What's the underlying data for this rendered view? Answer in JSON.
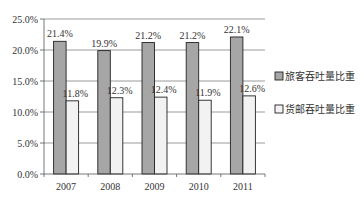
{
  "chart_data": {
    "type": "bar",
    "title": "",
    "xlabel": "",
    "ylabel": "",
    "categories": [
      "2007",
      "2008",
      "2009",
      "2010",
      "2011"
    ],
    "series": [
      {
        "name": "旅客吞吐量比重",
        "values": [
          21.4,
          19.9,
          21.2,
          21.2,
          22.1
        ],
        "labels": [
          "21.4%",
          "19.9%",
          "21.2%",
          "21.2%",
          "22.1%"
        ],
        "color": "#a6a6a6"
      },
      {
        "name": "货邮吞吐量比重",
        "values": [
          11.8,
          12.3,
          12.4,
          11.9,
          12.6
        ],
        "labels": [
          "11.8%",
          "12.3%",
          "12.4%",
          "11.9%",
          "12.6%"
        ],
        "color": "#f2f2f2"
      }
    ],
    "ylim": [
      0,
      25
    ],
    "yticks": [
      "0.0%",
      "5.0%",
      "10.0%",
      "15.0%",
      "20.0%",
      "25.0%"
    ],
    "ytick_values": [
      0,
      5,
      10,
      15,
      20,
      25
    ],
    "grid": true,
    "legend_position": "right"
  },
  "colors": {
    "series1": "#a6a6a6",
    "series2": "#f2f2f2",
    "gridline": "#808080",
    "bar_border": "#222222"
  }
}
